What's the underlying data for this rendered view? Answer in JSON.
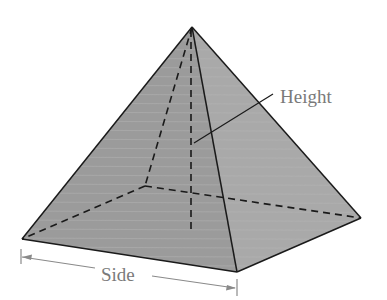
{
  "diagram": {
    "labels": {
      "height": "Height",
      "side": "Side"
    },
    "colors": {
      "background": "#ffffff",
      "left_face": "#9b9b9b",
      "right_face": "#a9a9a9",
      "edge": "#1a1a1a",
      "annotation": "#7a7a7a",
      "streak": "#b4b4b4"
    },
    "vertices": {
      "apex": [
        192,
        27
      ],
      "front_left": [
        22,
        239
      ],
      "front_right": [
        237,
        272
      ],
      "back_right": [
        361,
        218
      ],
      "back_left": [
        145,
        186
      ],
      "height_foot": [
        191,
        229
      ]
    }
  }
}
